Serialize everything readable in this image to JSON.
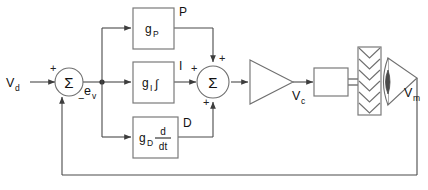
{
  "diagram": {
    "colors": {
      "wire": "#4a4a4a",
      "block_outline": "#7a7a7a",
      "text": "#111111",
      "background": "#ffffff"
    },
    "signals": {
      "input": "V",
      "input_sub": "d",
      "error": "e",
      "error_sub": "v",
      "command": "V",
      "command_sub": "c",
      "measured": "V",
      "measured_sub": "m"
    },
    "summing_junctions": [
      {
        "name": "error-summer",
        "symbol": "Σ",
        "signs": {
          "left": "+",
          "bottom": "−"
        }
      },
      {
        "name": "pid-summer",
        "symbol": "Σ",
        "signs": {
          "top": "+",
          "left": "+",
          "bottom": "+"
        }
      }
    ],
    "blocks": [
      {
        "name": "proportional-block",
        "gain": "g",
        "gain_sub": "P",
        "operator": "",
        "tag": "P"
      },
      {
        "name": "integral-block",
        "gain": "g",
        "gain_sub": "I",
        "operator": "∫",
        "tag": "I"
      },
      {
        "name": "derivative-block",
        "gain": "g",
        "gain_sub": "D",
        "operator_numerator": "d",
        "operator_denominator": "dt",
        "tag": "D"
      }
    ],
    "plant": {
      "amplifier_name": "amplifier-triangle",
      "coil_name": "coil-block",
      "stack_name": "chevron-stack",
      "stack_chevrons": 6,
      "transducer_name": "speaker-transducer"
    },
    "feedback": {
      "name": "feedback-path",
      "description": "measured signal returned to error summer"
    }
  }
}
